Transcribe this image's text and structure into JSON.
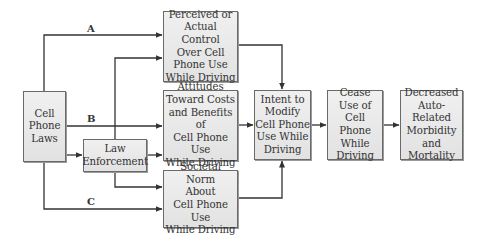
{
  "diagram": {
    "nodes": {
      "laws": "Cell\nPhone\nLaws",
      "enforcement": "Law\nEnforcement",
      "control": "Perceived or\nActual Control\nOver Cell\nPhone Use\nWhile Driving",
      "attitudes": "Attitudes\nToward Costs\nand Benefits of\nCell Phone Use\nWhile Driving",
      "norm": "Societal Norm\nAbout\nCell Phone Use\nWhile Driving",
      "intent": "Intent to\nModify\nCell Phone\nUse While\nDriving",
      "cease": "Cease\nUse of\nCell Phone\nWhile\nDriving",
      "outcome": "Decreased\nAuto-Related\nMorbidity\nand\nMortality"
    },
    "path_labels": {
      "a": "A",
      "b": "B",
      "c": "C"
    },
    "edges": [
      {
        "from": "laws",
        "to": "control",
        "label": "A"
      },
      {
        "from": "laws",
        "to": "attitudes",
        "label": "B"
      },
      {
        "from": "laws",
        "to": "norm",
        "label": "C"
      },
      {
        "from": "laws",
        "to": "enforcement"
      },
      {
        "from": "enforcement",
        "to": "control"
      },
      {
        "from": "enforcement",
        "to": "attitudes"
      },
      {
        "from": "enforcement",
        "to": "norm"
      },
      {
        "from": "control",
        "to": "intent"
      },
      {
        "from": "attitudes",
        "to": "intent"
      },
      {
        "from": "norm",
        "to": "intent"
      },
      {
        "from": "intent",
        "to": "cease"
      },
      {
        "from": "cease",
        "to": "outcome"
      }
    ]
  }
}
